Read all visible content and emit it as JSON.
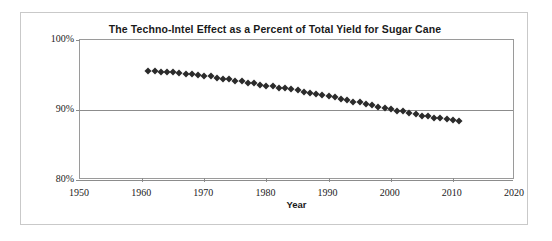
{
  "chart_data": {
    "type": "scatter",
    "title": "The Techno-Intel Effect as a Percent of Total Yield for Sugar Cane",
    "xlabel": "Year",
    "ylabel": "",
    "xlim": [
      1950,
      2020
    ],
    "ylim": [
      80,
      100
    ],
    "grid": true,
    "legend": "none",
    "marker": "diamond",
    "marker_color": "#2b2b2b",
    "xticks": [
      1950,
      1960,
      1970,
      1980,
      1990,
      2000,
      2010,
      2020
    ],
    "xtick_labels": [
      "1950",
      "1960",
      "1970",
      "1980",
      "1990",
      "2000",
      "2010",
      "2020"
    ],
    "yticks": [
      80,
      90,
      100
    ],
    "ytick_labels": [
      "80%",
      "90%",
      "100%"
    ],
    "x": [
      1961,
      1962,
      1963,
      1964,
      1965,
      1966,
      1967,
      1968,
      1969,
      1970,
      1971,
      1972,
      1973,
      1974,
      1975,
      1976,
      1977,
      1978,
      1979,
      1980,
      1981,
      1982,
      1983,
      1984,
      1985,
      1986,
      1987,
      1988,
      1989,
      1990,
      1991,
      1992,
      1993,
      1994,
      1995,
      1996,
      1997,
      1998,
      1999,
      2000,
      2001,
      2002,
      2003,
      2004,
      2005,
      2006,
      2007,
      2008,
      2009,
      2010,
      2011
    ],
    "values": [
      95.6,
      95.6,
      95.5,
      95.5,
      95.4,
      95.3,
      95.2,
      95.1,
      95.0,
      94.9,
      94.8,
      94.6,
      94.5,
      94.4,
      94.2,
      94.1,
      93.9,
      93.8,
      93.6,
      93.5,
      93.4,
      93.2,
      93.1,
      93.0,
      92.8,
      92.6,
      92.4,
      92.3,
      92.1,
      92.0,
      91.8,
      91.6,
      91.4,
      91.2,
      91.1,
      90.9,
      90.7,
      90.5,
      90.3,
      90.1,
      89.9,
      89.8,
      89.6,
      89.4,
      89.2,
      89.1,
      88.9,
      88.8,
      88.7,
      88.6,
      88.5
    ]
  },
  "axis": {
    "x_title": "Year"
  },
  "colors": {
    "marker": "#2b2b2b",
    "gridline": "#8c8c8c",
    "frame": "#c9c9c9",
    "text": "#1a1a1a"
  }
}
